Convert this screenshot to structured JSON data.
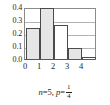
{
  "caption": {
    "n_symbol": "n",
    "n_equals": "=5,",
    "p_symbol": "p",
    "p_equals": "=",
    "p_numerator": "1",
    "p_denominator": "4"
  },
  "chart_data": {
    "type": "bar",
    "title": "",
    "subtitle": "n=5, p=1/4",
    "xlabel": "",
    "ylabel": "",
    "categories": [
      "0",
      "1",
      "2",
      "3",
      "4"
    ],
    "values": [
      0.2373,
      0.3955,
      0.2637,
      0.0879,
      0.0146
    ],
    "x_tick_labels": [
      "0",
      "1",
      "2",
      "3",
      "4"
    ],
    "y_tick_labels": [
      "0.0",
      "0.1",
      "0.2",
      "0.3",
      "0.4"
    ],
    "y_tick_values": [
      0.0,
      0.1,
      0.2,
      0.3,
      0.4
    ],
    "ylim": [
      0,
      0.4
    ],
    "grid": true,
    "legend": "none",
    "bar_fill": "#e6e6e6",
    "bar_stroke": "#4b4b4b",
    "gridline_color": "#b3b3b3",
    "axis_color": "#58595b",
    "background": "#ffffff"
  }
}
